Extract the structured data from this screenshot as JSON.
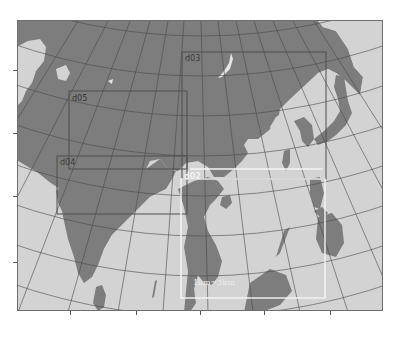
{
  "figure": {
    "type": "nested-domain-map",
    "colors": {
      "land": "#7d7d7d",
      "ocean": "#d3d3d3",
      "graticule": "#4a4a4a",
      "inner_domain_outline": "#4f4f4f",
      "d02_outline": "#f5f5f5",
      "frame": "#6e6e6e"
    }
  },
  "domains": [
    {
      "id": "d03",
      "label": "d03",
      "style": "dark"
    },
    {
      "id": "d05",
      "label": "d05",
      "style": "dark"
    },
    {
      "id": "d04",
      "label": "d04",
      "style": "dark"
    },
    {
      "id": "d02",
      "label": "d02",
      "style": "light"
    }
  ],
  "annotations": {
    "resolution_label": "1km~3km"
  }
}
